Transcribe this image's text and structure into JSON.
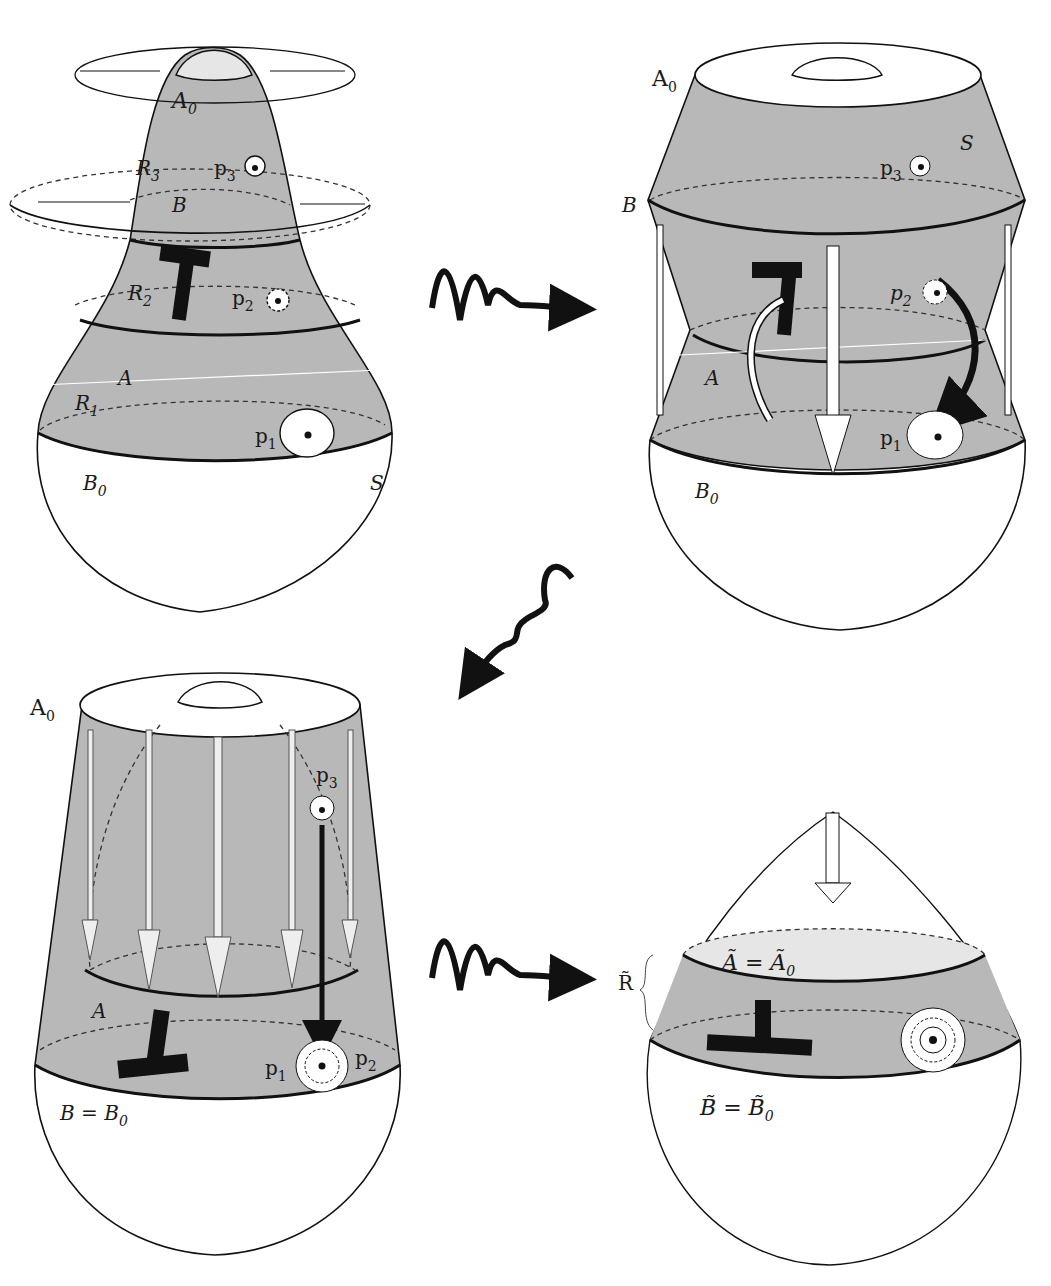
{
  "figure": {
    "panels": [
      {
        "id": "top-left",
        "labels": {
          "A0": "A",
          "A0_sub": "0",
          "R3": "R",
          "R3_sub": "3",
          "p3": "p",
          "p3_sub": "3",
          "B": "B",
          "R2": "R",
          "R2_sub": "2",
          "p2": "p",
          "p2_sub": "2",
          "A": "A",
          "R1": "R",
          "R1_sub": "1",
          "p1": "p",
          "p1_sub": "1",
          "B0": "B",
          "B0_sub": "0",
          "S": "S"
        }
      },
      {
        "id": "top-right",
        "labels": {
          "A0": "A",
          "A0_sub": "0",
          "S": "S",
          "p3": "p",
          "p3_sub": "3",
          "B": "B",
          "p2": "p",
          "p2_sub": "2",
          "A": "A",
          "p1": "p",
          "p1_sub": "1",
          "B0": "B",
          "B0_sub": "0"
        }
      },
      {
        "id": "bottom-left",
        "labels": {
          "A0": "A",
          "A0_sub": "0",
          "p3": "p",
          "p3_sub": "3",
          "A": "A",
          "p1": "p",
          "p1_sub": "1",
          "p2": "p",
          "p2_sub": "2",
          "B_eq": "B = B",
          "B_eq_sub": "0"
        }
      },
      {
        "id": "bottom-right",
        "labels": {
          "R_tilde": "R̃",
          "A_eq": "Ã = Ã",
          "A_eq_sub": "0",
          "B_eq": "B̃ = B̃",
          "B_eq_sub": "0"
        }
      }
    ],
    "transitions": [
      {
        "from": "top-left",
        "to": "top-right",
        "icon": "squiggly-arrow-right"
      },
      {
        "from": "top-right",
        "to": "bottom-left",
        "icon": "squiggly-arrow-down-left"
      },
      {
        "from": "bottom-left",
        "to": "bottom-right",
        "icon": "squiggly-arrow-right"
      }
    ],
    "colors": {
      "surface_gray": "#b8b8b8",
      "light_gray": "#e6e6e6",
      "ink": "#111111",
      "background": "#ffffff"
    }
  }
}
